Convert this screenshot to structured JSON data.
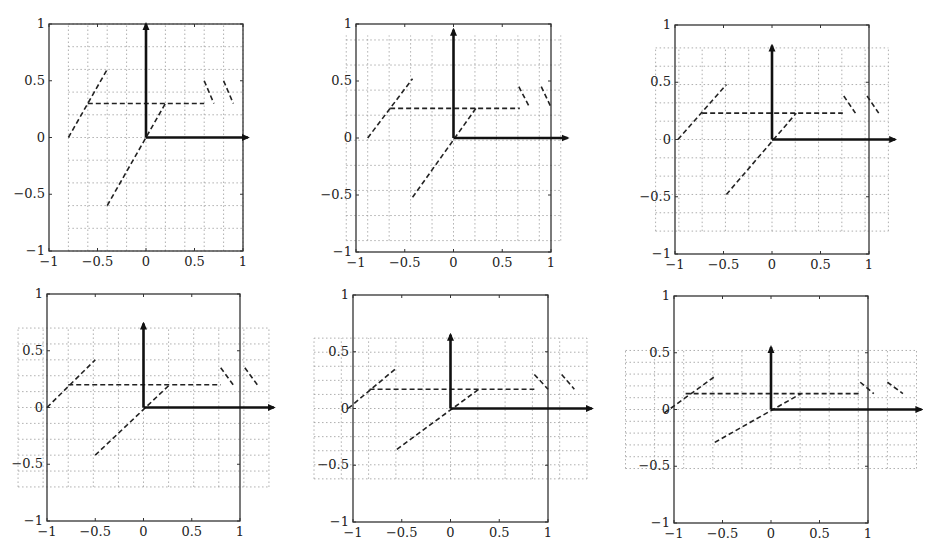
{
  "figure": {
    "layout": {
      "rows": 2,
      "cols": 3
    },
    "frame_color": "#333333",
    "grid_color": "#9a9a9a",
    "line_color": "#222222",
    "arrow_color": "#111111"
  },
  "chart_data": [
    {
      "type": "line",
      "title": "",
      "xlabel": "",
      "ylabel": "",
      "xlim": [
        -1,
        1
      ],
      "ylim": [
        -1,
        1
      ],
      "xticks": [
        "−1",
        "−0.5",
        "0",
        "0.5",
        "1"
      ],
      "yticks": [
        "−1",
        "−0.5",
        "0",
        "0.5",
        "1"
      ],
      "grid": {
        "on": true,
        "style": "dotted",
        "x_range": [
          -0.8,
          1.0
        ],
        "y_range": [
          -1.0,
          1.0
        ],
        "spacing": 0.2
      },
      "frame_px": {
        "left": 49,
        "top": 24,
        "right": 243,
        "bottom": 251
      },
      "arrows": [
        {
          "from": [
            0,
            0
          ],
          "to": [
            0,
            1.0
          ]
        },
        {
          "from": [
            0,
            0
          ],
          "to": [
            1.05,
            0
          ]
        }
      ],
      "dashed_segments": [
        {
          "from": [
            -0.8,
            0
          ],
          "to": [
            -0.4,
            0.6
          ]
        },
        {
          "from": [
            -0.6,
            0.3
          ],
          "to": [
            0.6,
            0.3
          ]
        },
        {
          "from": [
            -0.4,
            -0.6
          ],
          "to": [
            0.2,
            0.3
          ]
        },
        {
          "from": [
            0.6,
            0.5
          ],
          "to": [
            0.7,
            0.3
          ]
        },
        {
          "from": [
            0.8,
            0.5
          ],
          "to": [
            0.9,
            0.3
          ]
        }
      ]
    },
    {
      "type": "line",
      "title": "",
      "xlabel": "",
      "ylabel": "",
      "xlim": [
        -1,
        1
      ],
      "ylim": [
        -1,
        1
      ],
      "xticks": [
        "−1",
        "−0.5",
        "0",
        "0.5",
        "1"
      ],
      "yticks": [
        "−1",
        "−0.5",
        "0",
        "0.5",
        "1"
      ],
      "grid": {
        "on": true,
        "style": "dotted",
        "x_range": [
          -1.1,
          1.1
        ],
        "y_range": [
          -0.9,
          0.9
        ],
        "spacing": 0.22
      },
      "frame_px": {
        "left": 356,
        "top": 24,
        "right": 551,
        "bottom": 252
      },
      "arrows": [
        {
          "from": [
            0,
            0
          ],
          "to": [
            0,
            0.95
          ]
        },
        {
          "from": [
            0,
            0
          ],
          "to": [
            1.17,
            0
          ]
        }
      ],
      "dashed_segments": [
        {
          "from": [
            -0.88,
            0
          ],
          "to": [
            -0.42,
            0.52
          ]
        },
        {
          "from": [
            -0.65,
            0.26
          ],
          "to": [
            0.68,
            0.26
          ]
        },
        {
          "from": [
            -0.42,
            -0.52
          ],
          "to": [
            0.23,
            0.26
          ]
        },
        {
          "from": [
            0.67,
            0.45
          ],
          "to": [
            0.78,
            0.27
          ]
        },
        {
          "from": [
            0.9,
            0.45
          ],
          "to": [
            1.0,
            0.27
          ]
        }
      ]
    },
    {
      "type": "line",
      "title": "",
      "xlabel": "",
      "ylabel": "",
      "xlim": [
        -1,
        1
      ],
      "ylim": [
        -1,
        1
      ],
      "xticks": [
        "−1",
        "−0.5",
        "0",
        "0.5",
        "1"
      ],
      "yticks": [
        "−1",
        "−0.5",
        "0",
        "0.5",
        "1"
      ],
      "grid": {
        "on": true,
        "style": "dotted",
        "x_range": [
          -1.2,
          1.2
        ],
        "y_range": [
          -0.8,
          0.8
        ],
        "spacing_x": 0.24,
        "spacing_y": 0.16
      },
      "frame_px": {
        "left": 675,
        "top": 25,
        "right": 869,
        "bottom": 254
      },
      "arrows": [
        {
          "from": [
            0,
            0
          ],
          "to": [
            0,
            0.82
          ]
        },
        {
          "from": [
            0,
            0
          ],
          "to": [
            1.27,
            0
          ]
        }
      ],
      "dashed_segments": [
        {
          "from": [
            -0.97,
            0
          ],
          "to": [
            -0.47,
            0.48
          ]
        },
        {
          "from": [
            -0.72,
            0.23
          ],
          "to": [
            0.73,
            0.23
          ]
        },
        {
          "from": [
            -0.47,
            -0.48
          ],
          "to": [
            0.25,
            0.23
          ]
        },
        {
          "from": [
            0.74,
            0.38
          ],
          "to": [
            0.86,
            0.23
          ]
        },
        {
          "from": [
            0.98,
            0.38
          ],
          "to": [
            1.1,
            0.23
          ]
        }
      ]
    },
    {
      "type": "line",
      "title": "",
      "xlabel": "",
      "ylabel": "",
      "xlim": [
        -1,
        1
      ],
      "ylim": [
        -1,
        1
      ],
      "xticks": [
        "−1",
        "−0.5",
        "0",
        "0.5",
        "1"
      ],
      "yticks": [
        "−1",
        "−0.5",
        "0",
        "0.5",
        "1"
      ],
      "grid": {
        "on": true,
        "style": "dotted",
        "x_range": [
          -1.3,
          1.3
        ],
        "y_range": [
          -0.7,
          0.7
        ],
        "spacing_x": 0.26,
        "spacing_y": 0.14
      },
      "frame_px": {
        "left": 47,
        "top": 294,
        "right": 240,
        "bottom": 521
      },
      "arrows": [
        {
          "from": [
            0,
            0
          ],
          "to": [
            0,
            0.74
          ]
        },
        {
          "from": [
            0,
            0
          ],
          "to": [
            1.35,
            0
          ]
        }
      ],
      "dashed_segments": [
        {
          "from": [
            -1.0,
            0
          ],
          "to": [
            -0.5,
            0.42
          ]
        },
        {
          "from": [
            -0.78,
            0.2
          ],
          "to": [
            0.8,
            0.2
          ]
        },
        {
          "from": [
            -0.5,
            -0.42
          ],
          "to": [
            0.27,
            0.2
          ]
        },
        {
          "from": [
            0.8,
            0.35
          ],
          "to": [
            0.93,
            0.2
          ]
        },
        {
          "from": [
            1.05,
            0.35
          ],
          "to": [
            1.18,
            0.2
          ]
        }
      ]
    },
    {
      "type": "line",
      "title": "",
      "xlabel": "",
      "ylabel": "",
      "xlim": [
        -1,
        1
      ],
      "ylim": [
        -1,
        1
      ],
      "xticks": [
        "−1",
        "−0.5",
        "0",
        "0.5",
        "1"
      ],
      "yticks": [
        "−1",
        "−0.5",
        "0",
        "0.5",
        "1"
      ],
      "grid": {
        "on": true,
        "style": "dotted",
        "x_range": [
          -1.4,
          1.4
        ],
        "y_range": [
          -0.62,
          0.62
        ],
        "spacing_x": 0.28,
        "spacing_y": 0.124
      },
      "frame_px": {
        "left": 353,
        "top": 295,
        "right": 548,
        "bottom": 522
      },
      "arrows": [
        {
          "from": [
            0,
            0
          ],
          "to": [
            0,
            0.65
          ]
        },
        {
          "from": [
            0,
            0
          ],
          "to": [
            1.45,
            0
          ]
        }
      ],
      "dashed_segments": [
        {
          "from": [
            -1.05,
            0
          ],
          "to": [
            -0.55,
            0.36
          ]
        },
        {
          "from": [
            -0.83,
            0.17
          ],
          "to": [
            0.86,
            0.17
          ]
        },
        {
          "from": [
            -0.55,
            -0.36
          ],
          "to": [
            0.29,
            0.17
          ]
        },
        {
          "from": [
            0.86,
            0.3
          ],
          "to": [
            1.0,
            0.17
          ]
        },
        {
          "from": [
            1.14,
            0.3
          ],
          "to": [
            1.27,
            0.17
          ]
        }
      ]
    },
    {
      "type": "line",
      "title": "",
      "xlabel": "",
      "ylabel": "",
      "xlim": [
        -1,
        1
      ],
      "ylim": [
        -1,
        1
      ],
      "xticks": [
        "−1",
        "−0.5",
        "0",
        "0.5",
        "1"
      ],
      "yticks": [
        "−1",
        "−0.5",
        "0",
        "0.5",
        "1"
      ],
      "grid": {
        "on": true,
        "style": "dotted",
        "x_range": [
          -1.5,
          1.5
        ],
        "y_range": [
          -0.52,
          0.52
        ],
        "spacing_x": 0.3,
        "spacing_y": 0.104
      },
      "frame_px": {
        "left": 674,
        "top": 296,
        "right": 868,
        "bottom": 523
      },
      "arrows": [
        {
          "from": [
            0,
            0
          ],
          "to": [
            0,
            0.55
          ]
        },
        {
          "from": [
            0,
            0
          ],
          "to": [
            1.55,
            0
          ]
        }
      ],
      "dashed_segments": [
        {
          "from": [
            -1.1,
            -0.03
          ],
          "to": [
            -0.58,
            0.29
          ]
        },
        {
          "from": [
            -0.88,
            0.14
          ],
          "to": [
            0.91,
            0.14
          ]
        },
        {
          "from": [
            -0.58,
            -0.29
          ],
          "to": [
            0.31,
            0.14
          ]
        },
        {
          "from": [
            0.92,
            0.24
          ],
          "to": [
            1.06,
            0.14
          ]
        },
        {
          "from": [
            1.2,
            0.24
          ],
          "to": [
            1.36,
            0.14
          ]
        }
      ]
    }
  ]
}
